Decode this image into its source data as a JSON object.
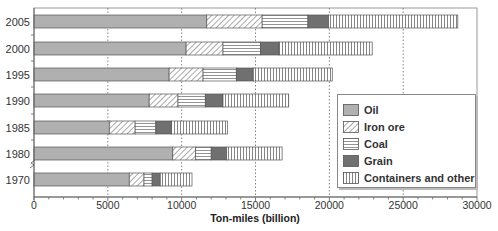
{
  "chart_data": {
    "type": "bar",
    "orientation": "horizontal",
    "stacked": true,
    "title": "",
    "xlabel": "Ton-miles (billion)",
    "ylabel": "",
    "xlim": [
      0,
      30000
    ],
    "xticks": [
      0,
      5000,
      10000,
      15000,
      20000,
      25000,
      30000
    ],
    "grid": {
      "vertical": true,
      "style": "dotted",
      "at": [
        5000,
        10000,
        15000,
        20000,
        25000
      ]
    },
    "categories": [
      "2005",
      "2000",
      "1995",
      "1990",
      "1985",
      "1980",
      "1970"
    ],
    "axis_break_between": [
      "1980",
      "1970"
    ],
    "series": [
      {
        "name": "Oil",
        "values": [
          11700,
          10300,
          9150,
          7800,
          5100,
          9400,
          6450
        ],
        "color": "#b0b0b0",
        "pattern": "solid"
      },
      {
        "name": "Iron ore",
        "values": [
          3750,
          2500,
          2300,
          1950,
          1750,
          1550,
          1000
        ],
        "color": "#ffffff",
        "pattern": "diagonal"
      },
      {
        "name": "Coal",
        "values": [
          3100,
          2550,
          2250,
          1850,
          1400,
          1050,
          550
        ],
        "color": "#ffffff",
        "pattern": "horizontal"
      },
      {
        "name": "Grain",
        "values": [
          1400,
          1250,
          1150,
          1200,
          1050,
          1050,
          550
        ],
        "color": "#707070",
        "pattern": "solid"
      },
      {
        "name": "Containers and other",
        "values": [
          8750,
          6300,
          5350,
          4450,
          3800,
          3750,
          2150
        ],
        "color": "#ffffff",
        "pattern": "vertical"
      }
    ],
    "totals": [
      28700,
      22900,
      20200,
      17250,
      13100,
      16800,
      10700
    ],
    "legend": {
      "position": "lower-right-inside",
      "entries": [
        "Oil",
        "Iron ore",
        "Coal",
        "Grain",
        "Containers and other"
      ]
    }
  }
}
